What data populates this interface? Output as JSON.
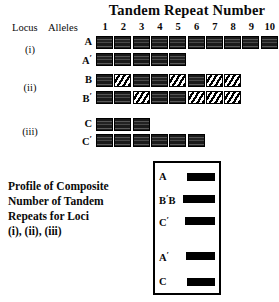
{
  "header": {
    "title": "Tandem  Repeat  Number",
    "locus_label": "Locus",
    "alleles_label": "Alleles",
    "column_numbers": [
      "1",
      "2",
      "3",
      "4",
      "5",
      "6",
      "7",
      "8",
      "9",
      "10"
    ]
  },
  "loci": [
    {
      "locus_label": "(i)",
      "alleles": [
        {
          "name": "A",
          "prime": "",
          "blocks": [
            "solid",
            "solid",
            "solid",
            "solid",
            "solid",
            "solid",
            "solid",
            "solid",
            "solid",
            "solid"
          ],
          "repeat_count": 10
        },
        {
          "name": "A",
          "prime": "′",
          "blocks": [
            "solid",
            "solid",
            "solid",
            "solid",
            "solid"
          ],
          "repeat_count": 5
        }
      ]
    },
    {
      "locus_label": "(ii)",
      "alleles": [
        {
          "name": "B",
          "prime": "",
          "blocks": [
            "solid",
            "hatched",
            "solid",
            "solid",
            "hatched",
            "solid",
            "hatched",
            "hatched"
          ],
          "repeat_count": 8
        },
        {
          "name": "B",
          "prime": "′",
          "blocks": [
            "solid",
            "solid",
            "hatched",
            "solid",
            "solid",
            "hatched",
            "hatched",
            "hatched"
          ],
          "repeat_count": 8
        }
      ]
    },
    {
      "locus_label": "(iii)",
      "alleles": [
        {
          "name": "C",
          "prime": "",
          "blocks": [
            "solid",
            "solid",
            "solid"
          ],
          "repeat_count": 3
        },
        {
          "name": "C",
          "prime": "′",
          "blocks": [
            "solid",
            "solid",
            "solid",
            "solid",
            "solid",
            "solid"
          ],
          "repeat_count": 6
        }
      ]
    }
  ],
  "profile": {
    "caption_lines": [
      "Profile of Composite",
      "Number of Tandem",
      "Repeats for Loci",
      "(i), (ii), (iii)"
    ],
    "lanes": [
      {
        "label": "A",
        "label_html": "A",
        "band_left": 32,
        "band_width": 28,
        "top": 7
      },
      {
        "label": "B′B",
        "label_html": "B′B",
        "band_left": 28,
        "band_width": 32,
        "top": 29
      },
      {
        "label": "C′",
        "label_html": "C′",
        "band_left": 30,
        "band_width": 30,
        "top": 51
      },
      {
        "label": "A′",
        "label_html": "A′",
        "band_left": 31,
        "band_width": 29,
        "top": 86
      },
      {
        "label": "C",
        "label_html": "C",
        "band_left": 32,
        "band_width": 28,
        "top": 112
      }
    ]
  },
  "colors": {
    "ink": "#0a0a0a",
    "band": "#000000",
    "paper": "#ffffff"
  }
}
